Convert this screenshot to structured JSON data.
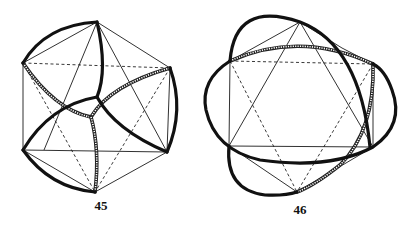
{
  "figures": [
    {
      "id": "45",
      "caption": "45",
      "caption_pos": [
        101,
        208
      ],
      "vertices": {
        "A": [
          97,
          22
        ],
        "B": [
          23,
          63
        ],
        "C": [
          170,
          68
        ],
        "D": [
          23,
          150
        ],
        "E": [
          167,
          152
        ],
        "F": [
          95,
          192
        ]
      },
      "thin_edges": [
        "M97 22 L23 63",
        "M97 22 L170 68",
        "M97 22 L44 150",
        "M97 22 L167 152",
        "M23 63 L23 150",
        "M170 68 L167 152",
        "M23 150 L167 152",
        "M23 150 L95 192",
        "M167 152 L95 192"
      ],
      "dashed_edges": [
        "M23 63 L170 68",
        "M23 63 L95 192",
        "M170 68 L95 192"
      ],
      "thick_arcs": [
        "M23 63 Q45 25 97 22",
        "M97 22 Q108 70 97 97",
        "M97 97 Q50 105 23 150",
        "M97 97 Q115 130 167 152",
        "M170 68 Q185 110 167 152",
        "M23 150 Q50 188 95 192"
      ],
      "hatched_arcs": [
        "M23 63 Q55 110 91 117",
        "M91 117 Q110 85 170 68",
        "M91 117 Q100 150 95 192"
      ]
    },
    {
      "id": "46",
      "caption": "46",
      "caption_pos": [
        300,
        212
      ],
      "vertices": {
        "A": [
          300,
          22
        ],
        "B": [
          230,
          61
        ],
        "C": [
          373,
          64
        ],
        "D": [
          229,
          146
        ],
        "E": [
          373,
          147
        ],
        "F": [
          297,
          192
        ]
      },
      "thin_edges": [
        "M300 22 L230 61",
        "M300 22 L342 48",
        "M342 48 L373 64",
        "M300 22 L229 146",
        "M300 22 L373 147",
        "M230 61 L229 146",
        "M373 64 L373 147",
        "M229 146 L373 147",
        "M229 146 L297 192",
        "M373 147 L297 192"
      ],
      "dashed_edges": [
        "M230 61 L373 64",
        "M230 61 L297 192",
        "M373 64 L297 192"
      ],
      "thick_arcs": [
        "M230 61 Q235 0 300 22 Q360 45 370 147",
        "M230 61 Q200 80 206 110 Q215 150 260 160 Q330 170 373 147 Q405 125 392 90 Q385 70 373 64",
        "M229 146 Q225 190 265 195 Q285 196 297 192"
      ],
      "hatched_arcs": [
        "M230 61 Q300 30 373 64",
        "M373 64 Q375 130 340 165 Q315 185 297 192"
      ]
    }
  ]
}
